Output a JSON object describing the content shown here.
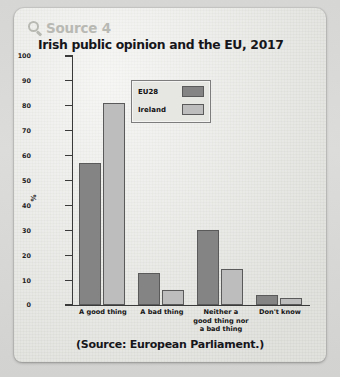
{
  "source_header": {
    "icon": "magnifier-icon",
    "label": "Source 4"
  },
  "title": "Irish public opinion and the EU, 2017",
  "caption": "(Source: European Parliament.)",
  "colors": {
    "eu28": "#848484",
    "ireland": "#bdbdbd",
    "panel": "#efefec",
    "axis": "#3a3a3a"
  },
  "chart_data": {
    "type": "bar",
    "title": "Irish public opinion and the EU, 2017",
    "xlabel": "",
    "ylabel": "%",
    "ylim": [
      0,
      100
    ],
    "yticks": [
      0,
      10,
      20,
      30,
      40,
      50,
      60,
      70,
      80,
      90,
      100
    ],
    "grid": false,
    "legend_position": "inside-top-center",
    "categories": [
      "A good thing",
      "A bad thing",
      "Neither a good thing nor a bad thing",
      "Don't know"
    ],
    "category_lines": [
      [
        "A good thing"
      ],
      [
        "A bad thing"
      ],
      [
        "Neither a",
        "good thing nor",
        "a bad thing"
      ],
      [
        "Don't know"
      ]
    ],
    "series": [
      {
        "name": "EU28",
        "values": [
          57,
          13,
          30,
          4
        ]
      },
      {
        "name": "Ireland",
        "values": [
          81,
          6,
          14.5,
          3
        ]
      }
    ]
  }
}
